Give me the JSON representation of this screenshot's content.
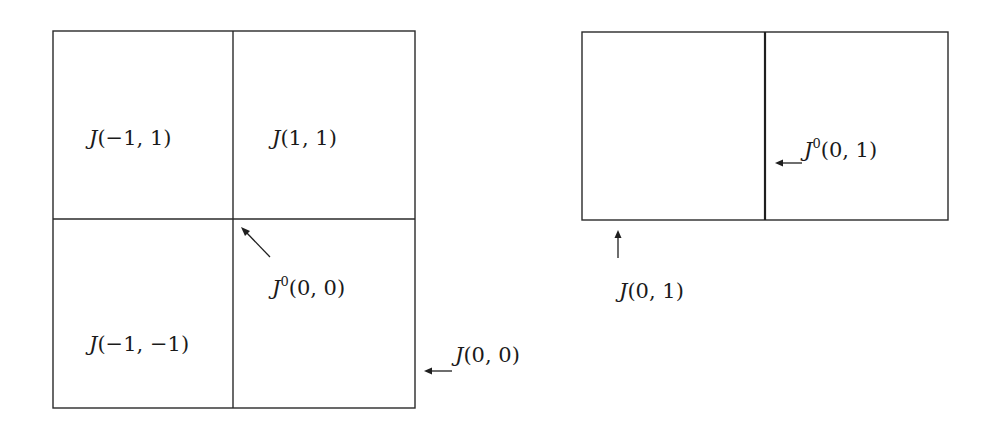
{
  "figure": {
    "left_panel": {
      "cells": {
        "top_left": {
          "name": "J",
          "args": "(−1, 1)"
        },
        "top_right": {
          "name": "J",
          "args": "(1, 1)"
        },
        "bottom_left": {
          "name": "J",
          "args": "(−1, −1)"
        }
      },
      "annotations": {
        "center_point": {
          "name": "J",
          "sup": "0",
          "args": "(0, 0)"
        },
        "right_edge": {
          "name": "J",
          "args": "(0, 0)"
        }
      }
    },
    "right_panel": {
      "annotations": {
        "divider": {
          "name": "J",
          "sup": "0",
          "args": "(0, 1)"
        },
        "bottom_edge": {
          "name": "J",
          "args": "(0, 1)"
        }
      }
    },
    "colors": {
      "line": "#2a2a2a",
      "text": "#1a1a1a",
      "background": "#ffffff"
    }
  }
}
